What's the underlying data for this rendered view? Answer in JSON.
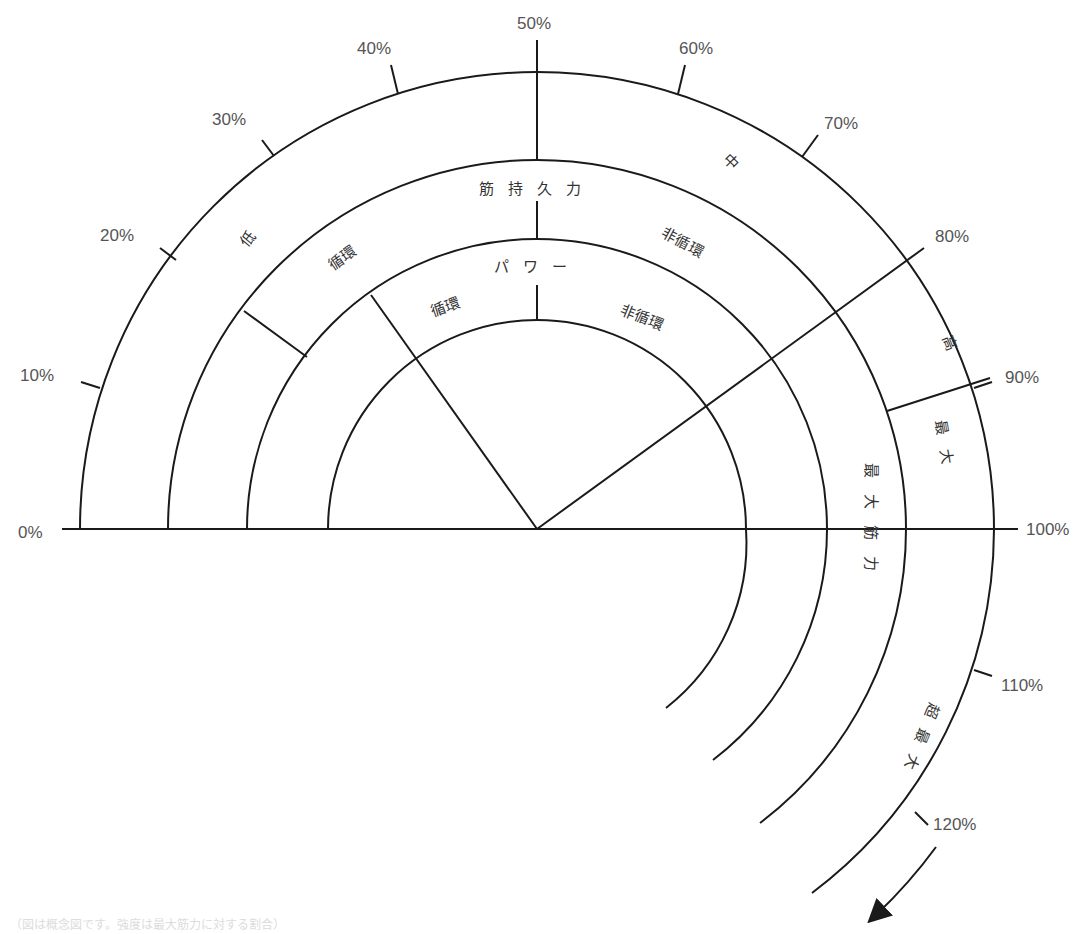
{
  "diagram": {
    "center": {
      "x": 537,
      "y": 529
    },
    "radii": {
      "power_inner": 209,
      "power_outer": 290,
      "endurance_outer": 369,
      "outer": 457
    },
    "percent_ticks": [
      {
        "label": "0%",
        "value": 0
      },
      {
        "label": "10%",
        "value": 10
      },
      {
        "label": "20%",
        "value": 20
      },
      {
        "label": "30%",
        "value": 30
      },
      {
        "label": "40%",
        "value": 40
      },
      {
        "label": "50%",
        "value": 50
      },
      {
        "label": "60%",
        "value": 60
      },
      {
        "label": "70%",
        "value": 70
      },
      {
        "label": "80%",
        "value": 80
      },
      {
        "label": "90%",
        "value": 90
      },
      {
        "label": "100%",
        "value": 100
      },
      {
        "label": "110%",
        "value": 110
      },
      {
        "label": "120%",
        "value": 120
      }
    ],
    "outer_ring": {
      "low": "低",
      "medium": "中",
      "high": "高",
      "max": "最大",
      "supramax": "超最大"
    },
    "endurance_ring": {
      "title": "筋持久力",
      "cyclic": "循環",
      "acyclic": "非循環"
    },
    "power_ring": {
      "title": "パワー",
      "cyclic": "循環",
      "acyclic": "非循環"
    },
    "max_strength_label": "最大筋力",
    "caption": "（図は概念図です。強度は最大筋力に対する割合）",
    "colors": {
      "line": "#1a1a1a",
      "text": "#555555",
      "background": "#ffffff"
    }
  }
}
